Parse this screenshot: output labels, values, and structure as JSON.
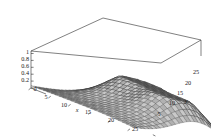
{
  "chart_data": {
    "type": "surface3d",
    "title": "",
    "xlabel": "x",
    "ylabel": "y",
    "zlabel": "",
    "grid": true,
    "legend": "none",
    "mesh": true,
    "shading": "grayscale-lighting",
    "xlim": [
      0,
      26
    ],
    "ylim": [
      0,
      26
    ],
    "zlim": [
      0,
      1
    ],
    "x_ticks": [
      "0",
      "5",
      "10",
      "15",
      "20",
      "25"
    ],
    "x_tick_values": [
      0,
      5,
      10,
      15,
      20,
      25
    ],
    "y_ticks": [
      "5",
      "10",
      "15",
      "20",
      "25"
    ],
    "y_tick_values": [
      5,
      10,
      15,
      20,
      25
    ],
    "z_ticks": [
      "0",
      "0.2",
      "0.4",
      "0.6",
      "0.8",
      "1"
    ],
    "z_tick_values": [
      0,
      0.2,
      0.4,
      0.6,
      0.8,
      1
    ],
    "surface_description": "Two broad domes (peaks near z=1) separated by a saddle valley, rising from a flat low plateau at the near corner",
    "peaks": [
      {
        "x": 8,
        "y": 20,
        "z": 1.0
      },
      {
        "x": 20,
        "y": 17,
        "z": 1.0
      }
    ],
    "saddle": {
      "x": 14,
      "y": 21,
      "z": 0.62
    },
    "mesh_rows": 26,
    "mesh_cols": 26,
    "colors": {
      "background": "#ffffff",
      "box": "#2b2b2b",
      "mesh": "#111111",
      "surface_light": "#c9c9c9",
      "surface_mid": "#7d7d7d",
      "surface_dark": "#3a3a3a",
      "text": "#1a1a1a"
    }
  },
  "axes": {
    "x": {
      "label": "x",
      "ticks": [
        {
          "text": "0",
          "x": 35,
          "y": 88
        },
        {
          "text": "5",
          "x": 46,
          "y": 97
        },
        {
          "text": "10",
          "x": 62,
          "y": 105
        },
        {
          "text": "15",
          "x": 85,
          "y": 112
        },
        {
          "text": "20",
          "x": 109,
          "y": 120
        },
        {
          "text": "25",
          "x": 133,
          "y": 130
        }
      ],
      "name_pos": {
        "x": 76,
        "y": 110
      }
    },
    "y": {
      "label": "y",
      "ticks": [
        {
          "text": "5",
          "x": 158,
          "y": 114
        },
        {
          "text": "10",
          "x": 170,
          "y": 103
        },
        {
          "text": "15",
          "x": 178,
          "y": 93
        },
        {
          "text": "20",
          "x": 186,
          "y": 83
        },
        {
          "text": "25",
          "x": 193,
          "y": 72
        }
      ],
      "name_pos": {
        "x": 184,
        "y": 101
      }
    },
    "z": {
      "label": "",
      "ticks": [
        {
          "text": "1",
          "x": 26,
          "y": 52
        },
        {
          "text": "0.8",
          "x": 21,
          "y": 59
        },
        {
          "text": "0.6",
          "x": 21,
          "y": 66
        },
        {
          "text": "0.4",
          "x": 21,
          "y": 73
        },
        {
          "text": "0.2",
          "x": 21,
          "y": 80
        },
        {
          "text": "0",
          "x": 35,
          "y": 88
        }
      ]
    }
  },
  "figure": {
    "caption": "",
    "kind": "3D surface plot"
  }
}
